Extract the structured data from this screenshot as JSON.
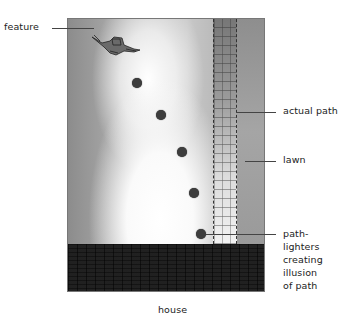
{
  "labels": {
    "feature": "feature",
    "actual_path": "actual path",
    "lawn": "lawn",
    "path_lighters": [
      "path-",
      "lighters",
      "creating",
      "illusion",
      "of path"
    ],
    "house": "house"
  },
  "path_lighters": [
    {
      "x": 137,
      "y": 83
    },
    {
      "x": 161,
      "y": 115
    },
    {
      "x": 182,
      "y": 152
    },
    {
      "x": 194,
      "y": 193
    },
    {
      "x": 201,
      "y": 234
    }
  ],
  "colors": {
    "lighter": "#3d3d3d",
    "wall": "#5a5a5a",
    "lawn_dark": "#8c8c8c"
  }
}
